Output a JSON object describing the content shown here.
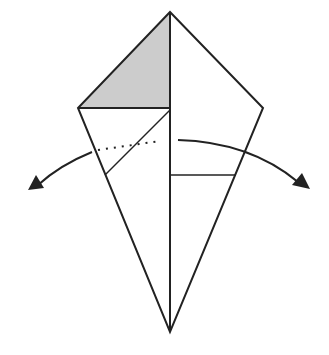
{
  "diagram": {
    "type": "origami-fold-step",
    "colors": {
      "line": "#222222",
      "shaded": "#cccccc",
      "background": "#ffffff"
    },
    "points": {
      "apex": [
        170,
        12
      ],
      "left_corner": [
        78,
        108
      ],
      "right_corner": [
        263,
        108
      ],
      "bottom": [
        170,
        332
      ]
    },
    "elements": [
      {
        "name": "shaded-flap",
        "desc": "gray triangle, top-left"
      },
      {
        "name": "center-crease",
        "desc": "vertical center line"
      },
      {
        "name": "left-diagonal-fold",
        "desc": "diagonal fold line on left flap"
      },
      {
        "name": "dotted-fold-line",
        "desc": "dotted valley line on left"
      },
      {
        "name": "right-horizontal-line",
        "desc": "horizontal edge on right flap"
      },
      {
        "name": "arrow-left",
        "desc": "curved arrow pointing down-left"
      },
      {
        "name": "arrow-right",
        "desc": "curved arrow pointing down-right"
      }
    ]
  }
}
